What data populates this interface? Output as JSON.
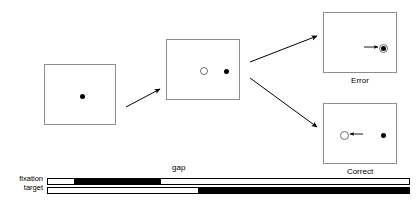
{
  "figure": {
    "title": "",
    "type": "gap-saccade-task-diagram"
  },
  "panels": [
    {
      "id": "panel-fixation",
      "name": "fixation-panel",
      "caption": "",
      "x": 44,
      "y": 64,
      "w": 72,
      "h": 61,
      "items": [
        {
          "kind": "filled-dot",
          "name": "fixation-dot",
          "cx": 37,
          "cy": 31,
          "r": 2.5
        }
      ]
    },
    {
      "id": "panel-gap",
      "name": "gap-panel",
      "caption": "",
      "x": 166,
      "y": 39,
      "w": 74,
      "h": 61,
      "items": [
        {
          "kind": "open-ring",
          "name": "fixation-offset-ring",
          "cx": 37,
          "cy": 31,
          "r": 4
        },
        {
          "kind": "filled-dot",
          "name": "target-dot",
          "cx": 59,
          "cy": 31,
          "r": 2.5
        }
      ]
    },
    {
      "id": "panel-error",
      "name": "error-outcome-panel",
      "caption": "Error",
      "x": 323,
      "y": 12,
      "w": 74,
      "h": 61,
      "items": [
        {
          "kind": "filled-dot",
          "name": "target-dot",
          "cx": 59,
          "cy": 35,
          "r": 2.5
        },
        {
          "kind": "open-ring",
          "name": "gaze-ring-on-target",
          "cx": 59,
          "cy": 35,
          "r": 4.5
        },
        {
          "kind": "arrow",
          "name": "saccade-arrow-right",
          "x1": 41,
          "y1": 35,
          "x2": 55,
          "y2": 35
        }
      ]
    },
    {
      "id": "panel-correct",
      "name": "correct-outcome-panel",
      "caption": "Correct",
      "x": 323,
      "y": 103,
      "w": 74,
      "h": 61,
      "items": [
        {
          "kind": "open-ring",
          "name": "gaze-ring-opposite",
          "cx": 20,
          "cy": 31,
          "r": 4.5
        },
        {
          "kind": "filled-dot",
          "name": "target-dot",
          "cx": 59,
          "cy": 31,
          "r": 2.5
        },
        {
          "kind": "arrow",
          "name": "antisaccade-arrow-left",
          "x1": 40,
          "y1": 31,
          "x2": 27,
          "y2": 31
        }
      ]
    }
  ],
  "connectors": [
    {
      "name": "arrow-fixation-to-gap",
      "x1": 126,
      "y1": 107,
      "x2": 160,
      "y2": 89
    },
    {
      "name": "arrow-gap-to-error",
      "x1": 250,
      "y1": 62,
      "x2": 317,
      "y2": 36
    },
    {
      "name": "arrow-gap-to-correct",
      "x1": 250,
      "y1": 78,
      "x2": 317,
      "y2": 127
    }
  ],
  "timeline": {
    "gap_label": "gap",
    "gap_label_x": 172,
    "gap_label_y": 163,
    "rows": [
      {
        "name": "fixation-track",
        "label": "fixation",
        "label_x": 6,
        "label_y": 174,
        "track_x": 47,
        "track_y": 178,
        "track_w": 363,
        "track_h": 7,
        "segments": [
          {
            "name": "fixation-on-segment",
            "start": 26,
            "width": 87
          }
        ]
      },
      {
        "name": "target-track",
        "label": "target",
        "label_x": 6,
        "label_y": 183,
        "track_x": 47,
        "track_y": 187,
        "track_w": 363,
        "track_h": 7,
        "segments": [
          {
            "name": "target-on-segment",
            "start": 150,
            "width": 212
          }
        ]
      }
    ]
  },
  "colors": {
    "ink": "#000000",
    "panel_border": "#8d8d8d",
    "ring_stroke": "#6f6f6f",
    "background": "#ffffff"
  }
}
